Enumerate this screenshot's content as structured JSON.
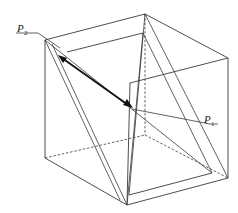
{
  "figure": {
    "type": "cube-with-inclined-planes",
    "labels": {
      "p2": {
        "main": "P",
        "sub": "2"
      },
      "p1": {
        "main": "P",
        "sub": "1"
      }
    },
    "colors": {
      "line": "#3a3a3a",
      "vector": "#111111",
      "background": "#ffffff"
    }
  }
}
